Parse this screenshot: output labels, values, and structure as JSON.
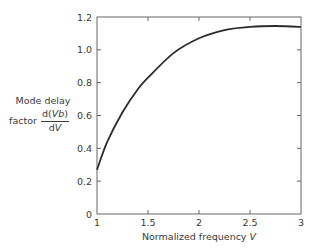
{
  "chart_data": {
    "type": "line",
    "title": "",
    "xlabel": "Normalized frequency V",
    "xlabel_text": "Normalized frequency",
    "xlabel_var": "V",
    "ylabel": "Mode delay factor d(Vb)/dV",
    "ylabel_line1": "Mode delay",
    "ylabel_prefix": "factor",
    "ylabel_num_a": "d(",
    "ylabel_num_var": "Vb",
    "ylabel_num_b": ")",
    "ylabel_den_a": "d",
    "ylabel_den_var": "V",
    "xlim": [
      1,
      3
    ],
    "ylim": [
      0,
      1.2
    ],
    "xticks": [
      1,
      1.5,
      2,
      2.5,
      3
    ],
    "xtick_labels": [
      "1",
      "1.5",
      "2",
      "2.5",
      "3"
    ],
    "yticks": [
      0,
      0.2,
      0.4,
      0.6,
      0.8,
      1.0,
      1.2
    ],
    "ytick_labels": [
      "0",
      "0.2",
      "0.4",
      "0.6",
      "0.8",
      "1.0",
      "1.2"
    ],
    "grid": false,
    "legend": null,
    "series": [
      {
        "name": "d(Vb)/dV",
        "x": [
          1.0,
          1.1,
          1.25,
          1.4,
          1.5,
          1.75,
          2.0,
          2.25,
          2.5,
          2.75,
          3.0
        ],
        "y": [
          0.27,
          0.44,
          0.62,
          0.76,
          0.83,
          0.98,
          1.07,
          1.12,
          1.14,
          1.145,
          1.14
        ]
      }
    ],
    "colors": {
      "line": "#2b2b2b",
      "axis": "#555555",
      "text": "#3a3a3a"
    }
  }
}
